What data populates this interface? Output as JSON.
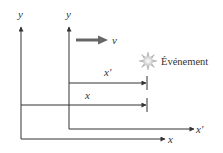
{
  "diagram": {
    "frames": {
      "S": {
        "y_axis_label": "y",
        "x_axis_label": "x"
      },
      "S_prime": {
        "y_axis_label": "y",
        "x_axis_label": "x′"
      }
    },
    "velocity": {
      "label": "v"
    },
    "event": {
      "label": "Événement"
    },
    "measurements": {
      "x_prime": {
        "label": "x′"
      },
      "x": {
        "label": "x"
      }
    },
    "colors": {
      "line": "#333333",
      "velocity_arrow": "#666666",
      "event_burst": "#bbbbbb"
    }
  }
}
